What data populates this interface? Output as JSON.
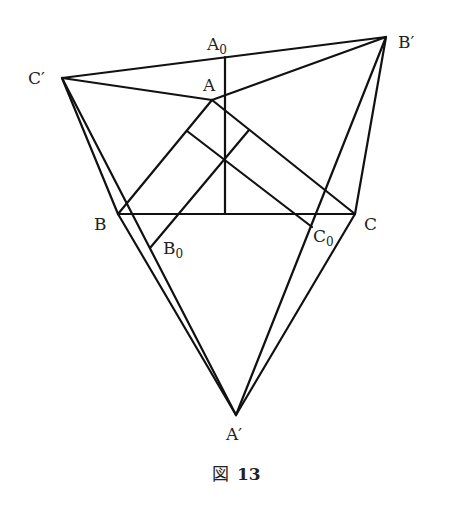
{
  "figure": {
    "caption_prefix": "図",
    "caption_number": "13",
    "line_color": "#111111",
    "text_color": "#222222"
  },
  "points": {
    "A": {
      "label": "A",
      "x": 212,
      "y": 100
    },
    "B": {
      "label": "B",
      "x": 118,
      "y": 214
    },
    "C": {
      "label": "C",
      "x": 355,
      "y": 214
    },
    "A_prime": {
      "label": "A′",
      "x": 236,
      "y": 415
    },
    "B_prime": {
      "label": "B′",
      "x": 386,
      "y": 37
    },
    "C_prime": {
      "label": "C′",
      "x": 62,
      "y": 78
    },
    "A0": {
      "label": "A",
      "sub": "0",
      "x": 225,
      "y": 57
    },
    "B0": {
      "label": "B",
      "sub": "0",
      "x": 150,
      "y": 248
    },
    "C0": {
      "label": "C",
      "sub": "0",
      "x": 312,
      "y": 227
    },
    "O": {
      "x": 225,
      "y": 160
    },
    "foot_AB": {
      "x": 187,
      "y": 131
    },
    "foot_AC": {
      "x": 249,
      "y": 130
    },
    "foot_BC": {
      "x": 225,
      "y": 214
    }
  }
}
